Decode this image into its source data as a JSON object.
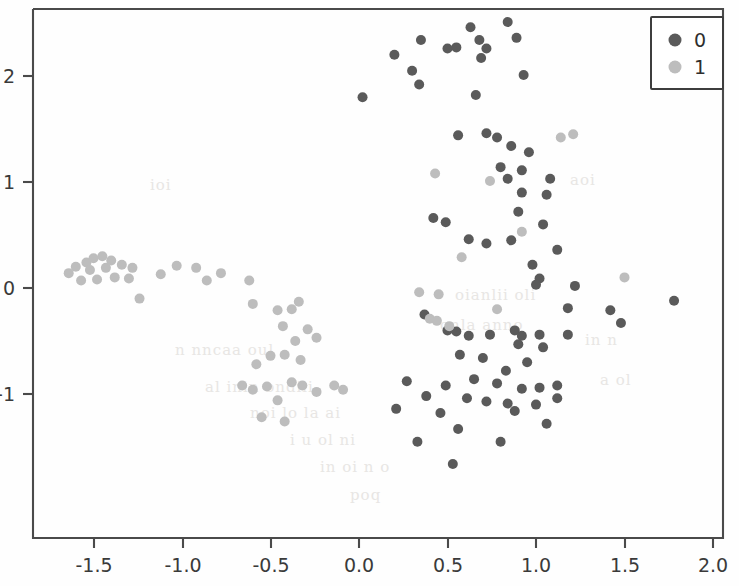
{
  "figure": {
    "background_color": "#fefefe",
    "axes_color": "#4a4a4a",
    "width": 739,
    "height": 586
  },
  "legend": {
    "entries": [
      {
        "label": "0",
        "color": "#5a5a5a"
      },
      {
        "label": "1",
        "color": "#bdbdbd"
      }
    ],
    "position": "upper-right",
    "frame_color": "#3d3d3d"
  },
  "axis": {
    "x_ticks": [
      "-1.5",
      "-1.0",
      "-0.5",
      "0.0",
      "0.5",
      "1.0",
      "1.5",
      "2.0"
    ],
    "y_ticks": [
      "2",
      "1",
      "0",
      "-1"
    ],
    "xlabel": "",
    "ylabel": "",
    "title": ""
  },
  "chart_data": {
    "type": "scatter",
    "title": "",
    "xlabel": "",
    "ylabel": "",
    "xlim": [
      -1.72,
      2.04
    ],
    "ylim": [
      -1.84,
      2.64
    ],
    "xticks": [
      -1.5,
      -1.0,
      -0.5,
      0.0,
      0.5,
      1.0,
      1.5,
      2.0
    ],
    "yticks": [
      -1,
      0,
      1,
      2
    ],
    "grid": false,
    "legend_position": "upper right",
    "marker_size": 10,
    "series": [
      {
        "name": "0",
        "color": "#5a5a5a",
        "points": [
          [
            0.02,
            1.8
          ],
          [
            0.2,
            2.2
          ],
          [
            0.35,
            2.34
          ],
          [
            0.3,
            2.05
          ],
          [
            0.34,
            1.92
          ],
          [
            0.5,
            2.26
          ],
          [
            0.55,
            2.27
          ],
          [
            0.63,
            2.46
          ],
          [
            0.68,
            2.34
          ],
          [
            0.72,
            2.26
          ],
          [
            0.69,
            2.17
          ],
          [
            0.84,
            2.51
          ],
          [
            0.89,
            2.36
          ],
          [
            0.93,
            2.01
          ],
          [
            0.66,
            1.82
          ],
          [
            0.56,
            1.44
          ],
          [
            0.72,
            1.46
          ],
          [
            0.78,
            1.42
          ],
          [
            0.86,
            1.34
          ],
          [
            0.96,
            1.28
          ],
          [
            0.8,
            1.14
          ],
          [
            0.92,
            1.11
          ],
          [
            0.84,
            1.03
          ],
          [
            1.08,
            1.03
          ],
          [
            0.92,
            0.9
          ],
          [
            1.06,
            0.88
          ],
          [
            0.42,
            0.66
          ],
          [
            0.49,
            0.62
          ],
          [
            0.9,
            0.72
          ],
          [
            1.04,
            0.6
          ],
          [
            0.62,
            0.46
          ],
          [
            0.72,
            0.42
          ],
          [
            0.86,
            0.45
          ],
          [
            1.12,
            0.36
          ],
          [
            0.98,
            0.22
          ],
          [
            1.02,
            0.09
          ],
          [
            1.0,
            0.03
          ],
          [
            1.22,
            0.02
          ],
          [
            1.78,
            -0.12
          ],
          [
            1.18,
            -0.19
          ],
          [
            1.42,
            -0.21
          ],
          [
            0.37,
            -0.25
          ],
          [
            0.5,
            -0.4
          ],
          [
            0.55,
            -0.41
          ],
          [
            0.62,
            -0.45
          ],
          [
            0.74,
            -0.44
          ],
          [
            0.88,
            -0.4
          ],
          [
            0.92,
            -0.45
          ],
          [
            1.02,
            -0.44
          ],
          [
            1.18,
            -0.44
          ],
          [
            1.48,
            -0.33
          ],
          [
            0.9,
            -0.53
          ],
          [
            1.04,
            -0.56
          ],
          [
            0.57,
            -0.63
          ],
          [
            0.7,
            -0.66
          ],
          [
            0.95,
            -0.7
          ],
          [
            0.83,
            -0.78
          ],
          [
            0.27,
            -0.88
          ],
          [
            0.49,
            -0.92
          ],
          [
            0.65,
            -0.86
          ],
          [
            0.78,
            -0.9
          ],
          [
            0.92,
            -0.95
          ],
          [
            1.02,
            -0.94
          ],
          [
            1.12,
            -0.92
          ],
          [
            0.38,
            -1.02
          ],
          [
            0.61,
            -1.04
          ],
          [
            0.72,
            -1.07
          ],
          [
            0.84,
            -1.09
          ],
          [
            1.0,
            -1.1
          ],
          [
            1.12,
            -1.04
          ],
          [
            0.21,
            -1.14
          ],
          [
            0.46,
            -1.18
          ],
          [
            0.88,
            -1.16
          ],
          [
            1.06,
            -1.28
          ],
          [
            0.56,
            -1.33
          ],
          [
            0.33,
            -1.45
          ],
          [
            0.8,
            -1.45
          ],
          [
            0.53,
            -1.66
          ]
        ]
      },
      {
        "name": "1",
        "color": "#bdbdbd",
        "points": [
          [
            -1.64,
            0.14
          ],
          [
            -1.6,
            0.2
          ],
          [
            -1.57,
            0.07
          ],
          [
            -1.54,
            0.24
          ],
          [
            -1.52,
            0.17
          ],
          [
            -1.5,
            0.28
          ],
          [
            -1.48,
            0.08
          ],
          [
            -1.45,
            0.3
          ],
          [
            -1.43,
            0.19
          ],
          [
            -1.4,
            0.26
          ],
          [
            -1.38,
            0.1
          ],
          [
            -1.34,
            0.22
          ],
          [
            -1.3,
            0.09
          ],
          [
            -1.28,
            0.19
          ],
          [
            -1.24,
            -0.1
          ],
          [
            -1.12,
            0.13
          ],
          [
            -1.03,
            0.21
          ],
          [
            -0.92,
            0.19
          ],
          [
            -0.86,
            0.07
          ],
          [
            -0.78,
            0.14
          ],
          [
            -0.62,
            0.07
          ],
          [
            -0.6,
            -0.15
          ],
          [
            -0.46,
            -0.21
          ],
          [
            -0.38,
            -0.2
          ],
          [
            -0.34,
            -0.13
          ],
          [
            -0.43,
            -0.36
          ],
          [
            -0.29,
            -0.39
          ],
          [
            -0.36,
            -0.5
          ],
          [
            -0.24,
            -0.47
          ],
          [
            -0.5,
            -0.64
          ],
          [
            -0.42,
            -0.63
          ],
          [
            -0.33,
            -0.68
          ],
          [
            -0.58,
            -0.72
          ],
          [
            -0.66,
            -0.92
          ],
          [
            -0.6,
            -0.96
          ],
          [
            -0.52,
            -0.93
          ],
          [
            -0.38,
            -0.89
          ],
          [
            -0.32,
            -0.92
          ],
          [
            -0.46,
            -1.06
          ],
          [
            -0.55,
            -1.22
          ],
          [
            -0.42,
            -1.26
          ],
          [
            -0.24,
            -0.98
          ],
          [
            -0.14,
            -0.92
          ],
          [
            -0.09,
            -0.96
          ],
          [
            0.43,
            1.08
          ],
          [
            0.74,
            1.01
          ],
          [
            1.14,
            1.42
          ],
          [
            1.21,
            1.45
          ],
          [
            0.92,
            0.53
          ],
          [
            0.58,
            0.29
          ],
          [
            0.34,
            -0.04
          ],
          [
            0.45,
            -0.06
          ],
          [
            0.4,
            -0.29
          ],
          [
            0.44,
            -0.31
          ],
          [
            0.51,
            -0.36
          ],
          [
            1.5,
            0.1
          ],
          [
            0.78,
            -0.2
          ]
        ]
      }
    ]
  }
}
